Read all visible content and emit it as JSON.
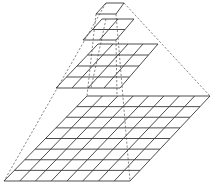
{
  "diagram": {
    "title": "",
    "colors": {
      "background": "#ffffff",
      "grid_stroke": "#3a3a3a",
      "dash_stroke": "#555555"
    },
    "levels": [
      {
        "name": "level-0",
        "cells": 1,
        "top_left": [
          106,
          3
        ],
        "top_right": [
          124,
          3
        ],
        "bottom_left": [
          96,
          14
        ],
        "bottom_right": [
          116,
          14
        ]
      },
      {
        "name": "level-1",
        "cells": 2,
        "top_left": [
          102,
          19
        ],
        "top_right": [
          134,
          19
        ],
        "bottom_left": [
          83,
          40
        ],
        "bottom_right": [
          116,
          40
        ]
      },
      {
        "name": "level-2",
        "cells": 4,
        "top_left": [
          98,
          44
        ],
        "top_right": [
          158,
          44
        ],
        "bottom_left": [
          56,
          88
        ],
        "bottom_right": [
          120,
          88
        ]
      },
      {
        "name": "level-3",
        "cells": 8,
        "top_left": [
          87,
          96
        ],
        "top_right": [
          210,
          96
        ],
        "bottom_left": [
          4,
          181
        ],
        "bottom_right": [
          130,
          181
        ]
      }
    ],
    "dashed_edges": [
      {
        "name": "outer-left-edge",
        "from": [
          106,
          3
        ],
        "to": [
          4,
          181
        ]
      },
      {
        "name": "outer-right-edge",
        "from": [
          124,
          3
        ],
        "to": [
          210,
          96
        ]
      },
      {
        "name": "inner-edge-a",
        "from": [
          116,
          14
        ],
        "to": [
          130,
          181
        ]
      },
      {
        "name": "inner-edge-b",
        "from": [
          96,
          14
        ],
        "to": [
          87,
          96
        ]
      },
      {
        "name": "inner-edge-c",
        "from": [
          106,
          19
        ],
        "to": [
          91,
          88
        ]
      },
      {
        "name": "inner-edge-d",
        "from": [
          116,
          40
        ],
        "to": [
          117,
          96
        ]
      }
    ]
  }
}
